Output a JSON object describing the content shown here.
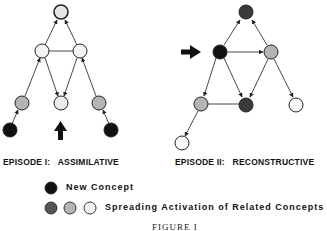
{
  "episodes": [
    {
      "label_prefix": "EPISODE I:",
      "label_name": "ASSIMILATIVE"
    },
    {
      "label_prefix": "EPISODE II:",
      "label_name": "RECONSTRUCTIVE"
    }
  ],
  "legend": {
    "new_concept": "New Concept",
    "spreading": "Spreading Activation of Related Concepts"
  },
  "caption": "FIGURE I",
  "colors": {
    "black": "#111111",
    "dark_gray": "#555555",
    "gray": "#b4b4b4",
    "light": "#ebebeb",
    "white": "#fafafa",
    "edge": "#333333"
  }
}
